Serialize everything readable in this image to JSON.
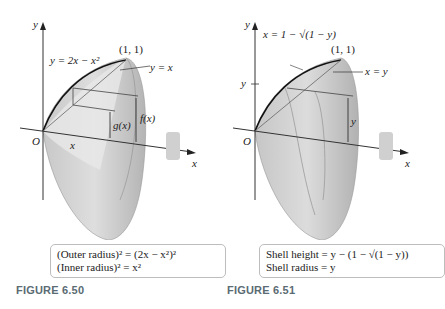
{
  "figures": [
    {
      "caption": "FIGURE 6.50",
      "labels": {
        "y_axis": "y",
        "x_axis": "x",
        "origin": "O",
        "curve": "y = 2x − x²",
        "point": "(1, 1)",
        "line": "y = x",
        "outer": "f(x)",
        "inner": "g(x)",
        "x_tick": "x"
      },
      "box_lines": [
        "(Outer radius)² = (2x − x²)²",
        "(Inner radius)² = x²"
      ]
    },
    {
      "caption": "FIGURE 6.51",
      "labels": {
        "y_axis": "y",
        "x_axis": "x",
        "origin": "O",
        "curve": "x = 1 − √(1 − y)",
        "point": "(1, 1)",
        "line": "x = y",
        "y_tick": "y",
        "height": "y"
      },
      "box_lines": [
        "Shell height = y − (1 − √(1 − y))",
        "Shell radius = y"
      ]
    }
  ],
  "colors": {
    "solid_light": "#d9d9d9",
    "solid_dark": "#a8a8a8",
    "caption": "#5a6b73",
    "box_border": "#bdbdbd"
  }
}
